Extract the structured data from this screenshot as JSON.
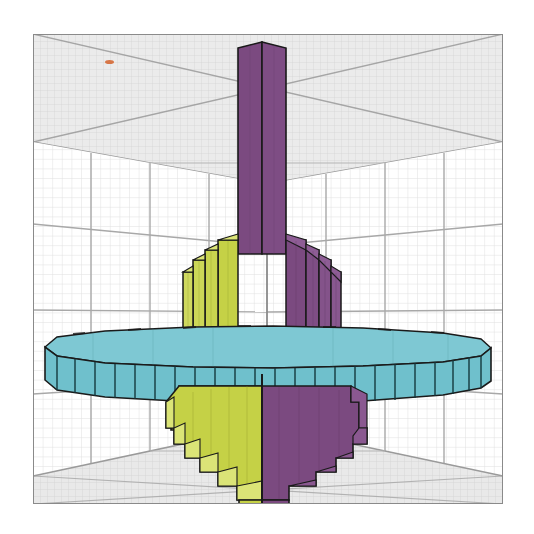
{
  "figure": {
    "type": "3d-voxel-plot",
    "width": 534,
    "height": 534,
    "background_color": "#ffffff",
    "title": "",
    "axis_labels": {
      "x": "",
      "y": "",
      "z": ""
    },
    "tick_labels": [],
    "legend": []
  },
  "axes_box": {
    "left": 33,
    "top": 34,
    "width": 470,
    "height": 470,
    "frame_color": "#8a8a8a",
    "pane_color": "#ffffff",
    "floor_color": "#e8e8e8",
    "ceiling_color": "#ededed",
    "minor_grid_color": "#dcdcdc",
    "major_grid_color": "#9a9a9a",
    "minor_grid_count": 48,
    "major_grid_count": 4
  },
  "marker": {
    "name": "orange-marker-dot",
    "color": "#d4622a",
    "x": 105,
    "y": 60,
    "width": 9,
    "height": 4
  },
  "chart_data": {
    "type": "voxel3d",
    "xlabel": "",
    "ylabel": "",
    "zlabel": "",
    "grid": true,
    "legend_position": "none",
    "colors": {
      "shaft": "#7b4a80",
      "body_left": "#c5d146",
      "body_right": "#7b4a80",
      "disk": "#6fc0cc",
      "cone_left": "#c5d146",
      "cone_right": "#7b4a80",
      "edge": "#1a1a1a"
    },
    "components": [
      {
        "name": "shaft",
        "description": "tall vertical square column at top",
        "color_left": "#7b4a80",
        "color_right": "#7b4a80",
        "x_center": 262,
        "top": 45,
        "bottom": 247,
        "half_width": 24
      },
      {
        "name": "upper-body",
        "description": "stepped cylindrical body above the disk",
        "color_left": "#c5d146",
        "color_right": "#7b4a80",
        "x_center": 262,
        "top": 238,
        "bottom": 338,
        "steps": [
          {
            "half_width": 34,
            "top": 238
          },
          {
            "half_width": 44,
            "top": 250
          },
          {
            "half_width": 52,
            "top": 262
          },
          {
            "half_width": 58,
            "top": 272
          }
        ]
      },
      {
        "name": "disk",
        "description": "wide flat cyan disk (flywheel)",
        "color": "#6fc0cc",
        "x_left": 45,
        "x_right": 488,
        "top": 333,
        "bottom": 390,
        "rim_segments": 46
      },
      {
        "name": "lower-cone",
        "description": "inverted stepped cone below the disk",
        "color_left": "#c5d146",
        "color_right": "#7b4a80",
        "x_center": 262,
        "top": 386,
        "bottom": 492,
        "steps": [
          {
            "half_width": 82,
            "top": 386
          },
          {
            "half_width": 74,
            "top": 398
          },
          {
            "half_width": 66,
            "top": 409
          },
          {
            "half_width": 58,
            "top": 419
          },
          {
            "half_width": 50,
            "top": 430
          },
          {
            "half_width": 42,
            "top": 440
          },
          {
            "half_width": 34,
            "top": 450
          },
          {
            "half_width": 26,
            "top": 460
          },
          {
            "half_width": 20,
            "top": 470
          },
          {
            "half_width": 24,
            "top": 479
          }
        ]
      }
    ]
  },
  "interaction": {
    "pan_zoom_enabled": true,
    "rotate_enabled": true
  }
}
